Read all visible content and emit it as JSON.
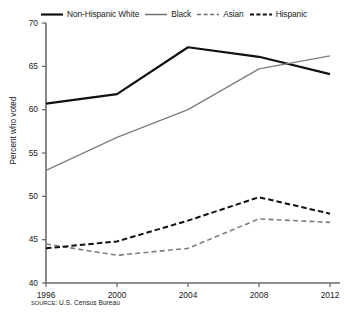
{
  "chart_data": {
    "type": "line",
    "title": "",
    "subtitle": "",
    "xlabel": "",
    "ylabel": "Percent who voted",
    "categories": [
      "1996",
      "2000",
      "2004",
      "2008",
      "2012"
    ],
    "x": [
      1996,
      2000,
      2004,
      2008,
      2012
    ],
    "xlim": [
      1996,
      2012
    ],
    "ylim": [
      40,
      70
    ],
    "yticks": [
      40,
      45,
      50,
      55,
      60,
      65,
      70
    ],
    "xticks": [
      "1996",
      "2000",
      "2004",
      "2008",
      "2012"
    ],
    "grid": false,
    "legend_position": "top-center",
    "source_note": "SOURCE: U.S. Census Bureau",
    "series": [
      {
        "name": "Non-Hispanic White",
        "values": [
          60.7,
          61.8,
          67.2,
          66.1,
          64.1
        ],
        "color": "#111111",
        "style": "solid",
        "width": 2.2
      },
      {
        "name": "Black",
        "values": [
          53.0,
          56.8,
          60.0,
          64.7,
          66.2
        ],
        "color": "#7d7d7d",
        "style": "solid",
        "width": 1.3
      },
      {
        "name": "Asian",
        "values": [
          44.5,
          43.2,
          44.0,
          47.4,
          47.0
        ],
        "color": "#7d7d7d",
        "style": "dashed",
        "width": 1.6
      },
      {
        "name": "Hispanic",
        "values": [
          44.0,
          44.8,
          47.2,
          49.9,
          48.0
        ],
        "color": "#111111",
        "style": "dashed",
        "width": 2.0
      }
    ]
  },
  "legend": {
    "items": [
      {
        "label": "Non-Hispanic White",
        "swatch": "solid-thick-black-line-icon"
      },
      {
        "label": "Black",
        "swatch": "solid-thin-gray-line-icon"
      },
      {
        "label": "Asian",
        "swatch": "dashed-thin-gray-line-icon"
      },
      {
        "label": "Hispanic",
        "swatch": "dashed-thick-black-line-icon"
      }
    ]
  },
  "axes": {
    "y_title": "Percent who voted",
    "y_ticks": [
      "70",
      "65",
      "60",
      "55",
      "50",
      "45",
      "40"
    ],
    "x_ticks": [
      "1996",
      "2000",
      "2004",
      "2008",
      "2012"
    ]
  },
  "footer": {
    "source_prefix": "SOURCE",
    "source_text": ": U.S. Census Bureau"
  },
  "colors": {
    "background": "#ffffff",
    "axis": "#6b6b6b",
    "dark_series": "#111111",
    "light_series": "#7d7d7d",
    "text": "#1a1a1a"
  }
}
